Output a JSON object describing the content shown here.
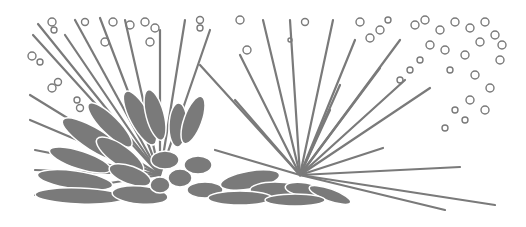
{
  "image": {
    "description": "Monochrome grey line illustration of radiating crystal growth (spherulite clusters) with needle-like rays and scattered bubbles",
    "colors": {
      "background": "#ffffff",
      "ink": "#7a7a7a"
    }
  }
}
